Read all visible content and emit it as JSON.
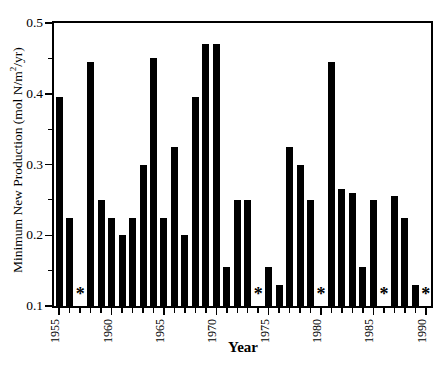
{
  "figure": {
    "background": "#ffffff",
    "ink_color": "#000000",
    "ylabel_pre": "Minimum New Production (mol N/m",
    "ylabel_sup": "2",
    "ylabel_post": "/yr)",
    "xlabel": "Year",
    "y_tick_labels": [
      "0.1",
      "0.2",
      "0.3",
      "0.4",
      "0.5"
    ],
    "x_tick_labels": [
      "1955",
      "1960",
      "1965",
      "1970",
      "1975",
      "1980",
      "1985",
      "1990"
    ],
    "missing_marker": "*"
  },
  "chart_data": {
    "type": "bar",
    "title": "",
    "xlabel": "Year",
    "ylabel": "Minimum New Production (mol N/m2/yr)",
    "ylim": [
      0.1,
      0.5
    ],
    "y_major_step": 0.1,
    "y_minor_step": 0.05,
    "x_range": [
      1955,
      1990
    ],
    "x_labeled_ticks": [
      1955,
      1960,
      1965,
      1970,
      1975,
      1980,
      1985,
      1990
    ],
    "grid": false,
    "legend": null,
    "bar_color": "#000000",
    "missing_marker": "*",
    "missing_years": [
      1957,
      1974,
      1980,
      1986,
      1990
    ],
    "years": [
      1955,
      1956,
      1957,
      1958,
      1959,
      1960,
      1961,
      1962,
      1963,
      1964,
      1965,
      1966,
      1967,
      1968,
      1969,
      1970,
      1971,
      1972,
      1973,
      1974,
      1975,
      1976,
      1977,
      1978,
      1979,
      1980,
      1981,
      1982,
      1983,
      1984,
      1985,
      1986,
      1987,
      1988,
      1989,
      1990
    ],
    "values": [
      0.395,
      0.225,
      null,
      0.445,
      0.25,
      0.225,
      0.2,
      0.225,
      0.3,
      0.45,
      0.225,
      0.325,
      0.2,
      0.395,
      0.47,
      0.47,
      0.155,
      0.25,
      0.25,
      null,
      0.155,
      0.13,
      0.325,
      0.3,
      0.25,
      null,
      0.445,
      0.265,
      0.26,
      0.155,
      0.25,
      null,
      0.255,
      0.225,
      0.13,
      null
    ]
  }
}
